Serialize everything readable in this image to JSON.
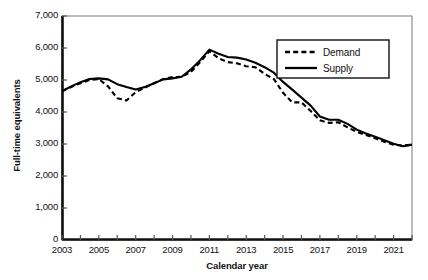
{
  "chart_data": {
    "type": "line",
    "title": "",
    "xlabel": "Calendar year",
    "ylabel": "Full-time equivalents",
    "xlim": [
      2003,
      2022
    ],
    "ylim": [
      0,
      7000
    ],
    "ytick_values": [
      0,
      1000,
      2000,
      3000,
      4000,
      5000,
      6000,
      7000
    ],
    "ytick_labels": [
      "0",
      "1,000",
      "2,000",
      "3,000",
      "4,000",
      "5,000",
      "6,000",
      "7,000"
    ],
    "xtick_values": [
      2003,
      2004,
      2005,
      2006,
      2007,
      2008,
      2009,
      2010,
      2011,
      2012,
      2013,
      2014,
      2015,
      2016,
      2017,
      2018,
      2019,
      2020,
      2021,
      2022
    ],
    "xtick_labels_shown": [
      "2003",
      "2005",
      "2007",
      "2009",
      "2011",
      "2013",
      "2015",
      "2017",
      "2019",
      "2021"
    ],
    "xtick_label_values": [
      2003,
      2005,
      2007,
      2009,
      2011,
      2013,
      2015,
      2017,
      2019,
      2021
    ],
    "grid": false,
    "legend_position": "upper-right",
    "x": [
      2003,
      2003.5,
      2004,
      2004.5,
      2005,
      2005.5,
      2006,
      2006.5,
      2007,
      2007.5,
      2008,
      2008.5,
      2009,
      2009.5,
      2010,
      2010.5,
      2011,
      2011.5,
      2012,
      2012.5,
      2013,
      2013.5,
      2014,
      2014.5,
      2015,
      2015.5,
      2016,
      2016.5,
      2017,
      2017.5,
      2018,
      2018.5,
      2019,
      2019.5,
      2020,
      2020.5,
      2021,
      2021.5,
      2022
    ],
    "series": [
      {
        "name": "Demand",
        "style": "dashed",
        "color": "#000000",
        "values": [
          4650,
          4780,
          4900,
          5000,
          5030,
          4800,
          4430,
          4360,
          4620,
          4760,
          4900,
          5030,
          5090,
          5100,
          5250,
          5560,
          5900,
          5680,
          5560,
          5520,
          5430,
          5400,
          5190,
          5030,
          4600,
          4300,
          4300,
          4030,
          3740,
          3660,
          3680,
          3520,
          3380,
          3280,
          3180,
          3070,
          2980,
          2950,
          2980
        ]
      },
      {
        "name": "Supply",
        "style": "solid",
        "color": "#000000",
        "values": [
          4650,
          4800,
          4930,
          5030,
          5050,
          5020,
          4870,
          4780,
          4700,
          4780,
          4900,
          5020,
          5050,
          5100,
          5330,
          5620,
          5950,
          5820,
          5720,
          5700,
          5640,
          5540,
          5400,
          5230,
          4940,
          4700,
          4450,
          4200,
          3860,
          3760,
          3760,
          3630,
          3450,
          3330,
          3230,
          3120,
          3010,
          2930,
          2980
        ]
      }
    ]
  },
  "legend": {
    "items": [
      {
        "label": "Demand",
        "style": "dashed"
      },
      {
        "label": "Supply",
        "style": "solid"
      }
    ]
  }
}
